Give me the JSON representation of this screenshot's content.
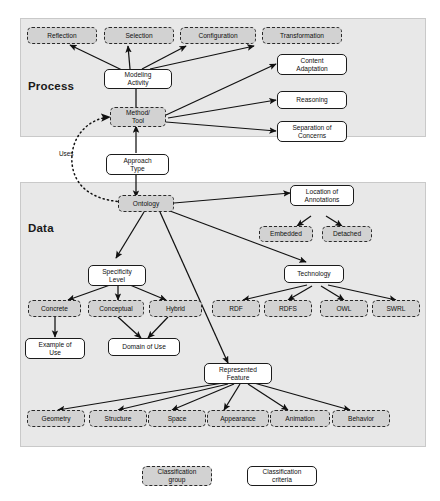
{
  "figure": {
    "sections": [
      {
        "id": "process",
        "label": "Process"
      },
      {
        "id": "data",
        "label": "Data"
      }
    ],
    "edge_labels": [
      {
        "id": "uses",
        "text": "Uses"
      }
    ],
    "legend": {
      "group": "Classification\ngroup",
      "criteria": "Classification\ncriteria"
    },
    "nodes": {
      "reflection": "Reflection",
      "selection": "Selection",
      "configuration": "Configuration",
      "transformation": "Transformation",
      "modeling_activity": "Modeling\nActivity",
      "method_tool": "Method/\nTool",
      "content_adaptation": "Content\nAdaptation",
      "reasoning": "Reasoning",
      "separation_of_concerns": "Separation of\nConcerns",
      "approach_type": "Approach\nType",
      "ontology": "Ontology",
      "location_of_annotations": "Location of\nAnnotations",
      "embedded": "Embedded",
      "detached": "Detached",
      "specificity_level": "Specificity\nLevel",
      "technology": "Technology",
      "concrete": "Concrete",
      "conceptual": "Conceptual",
      "hybrid": "Hybrid",
      "rdf": "RDF",
      "rdfs": "RDFS",
      "owl": "OWL",
      "swrl": "SWRL",
      "example_of_use": "Example of\nUse",
      "domain_of_use": "Domain of Use",
      "represented_feature": "Represented\nFeature",
      "geometry": "Geometry",
      "structure": "Structure",
      "space": "Space",
      "appearance": "Appearance",
      "animation": "Animation",
      "behavior": "Behavior"
    }
  }
}
